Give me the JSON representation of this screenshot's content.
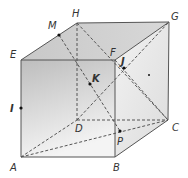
{
  "diagram": {
    "colors": {
      "edge": "#555555",
      "dashed": "#555555",
      "front_face_top": "#bdbdbd",
      "front_face_bottom": "#f2f2f2",
      "top_face": "#cfcfcf",
      "right_face": "#e6e6e6"
    },
    "vertices": {
      "A": {
        "label": "A",
        "x": 21,
        "y": 157,
        "lx": 10,
        "ly": 171
      },
      "B": {
        "label": "B",
        "x": 115,
        "y": 157,
        "lx": 113,
        "ly": 171
      },
      "C": {
        "label": "C",
        "x": 168,
        "y": 120,
        "lx": 172,
        "ly": 131
      },
      "D": {
        "label": "D",
        "x": 77,
        "y": 120,
        "lx": 75,
        "ly": 132
      },
      "E": {
        "label": "E",
        "x": 21,
        "y": 60,
        "lx": 10,
        "ly": 58
      },
      "F": {
        "label": "F",
        "x": 115,
        "y": 60,
        "lx": 110,
        "ly": 56
      },
      "G": {
        "label": "G",
        "x": 169,
        "y": 22,
        "lx": 171,
        "ly": 20
      },
      "H": {
        "label": "H",
        "x": 77,
        "y": 23,
        "lx": 72,
        "ly": 17
      }
    },
    "points": {
      "I": {
        "label": "I",
        "x": 21,
        "y": 108,
        "lx": 10,
        "ly": 112
      },
      "J": {
        "label": "J",
        "x": 124,
        "y": 68,
        "lx": 122,
        "ly": 64
      },
      "K": {
        "label": "K",
        "x": 90,
        "y": 84,
        "lx": 92,
        "ly": 82
      },
      "M": {
        "label": "M",
        "x": 59,
        "y": 35,
        "lx": 49,
        "ly": 28
      },
      "P": {
        "label": "P",
        "x": 120,
        "y": 131,
        "lx": 118,
        "ly": 145
      }
    },
    "labels": {
      "A": "A",
      "B": "B",
      "C": "C",
      "D": "D",
      "E": "E",
      "F": "F",
      "G": "G",
      "H": "H",
      "I": "I",
      "J": "J",
      "K": "K",
      "M": "M",
      "P": "P"
    }
  }
}
